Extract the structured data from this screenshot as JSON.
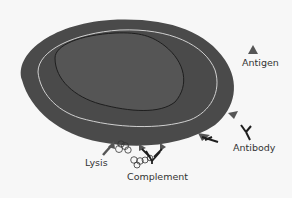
{
  "diagram": {
    "type": "immunology-illustration",
    "labels": {
      "antigen": "Antigen",
      "antibody": "Antibody",
      "lysis": "Lysis",
      "complement": "Complement"
    },
    "colors": {
      "background": "#f7f7f7",
      "cell_outer": "#4a4a4a",
      "cell_inner": "#555555",
      "membrane_line": "#d0d0d0",
      "nucleus_outline": "#1e1e1e",
      "antigen": "#555555",
      "antibody": "#1e1e1e",
      "text": "#333333"
    }
  }
}
